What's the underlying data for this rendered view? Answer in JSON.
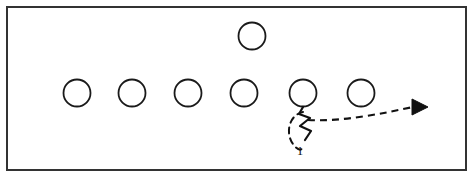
{
  "diagram": {
    "canvas": {
      "width": 474,
      "height": 177,
      "background": "#ffffff"
    },
    "frame": {
      "x": 7,
      "y": 7,
      "width": 459,
      "height": 163,
      "stroke": "#333333",
      "stroke_width": 2
    },
    "colors": {
      "ink": "#111111",
      "circle_stroke": "#1a1a1a",
      "frame_stroke": "#333333",
      "fill": "#ffffff"
    },
    "players": [
      {
        "id": "player-1",
        "label": "",
        "cx": 77,
        "cy": 93,
        "r": 13.5,
        "row": "line"
      },
      {
        "id": "player-2",
        "label": "",
        "cx": 132,
        "cy": 93,
        "r": 13.5,
        "row": "line"
      },
      {
        "id": "player-3",
        "label": "",
        "cx": 188,
        "cy": 93,
        "r": 13.5,
        "row": "line"
      },
      {
        "id": "player-4",
        "label": "",
        "cx": 244,
        "cy": 93,
        "r": 13.5,
        "row": "line"
      },
      {
        "id": "player-5",
        "label": "",
        "cx": 303,
        "cy": 93,
        "r": 13.5,
        "row": "line"
      },
      {
        "id": "player-6",
        "label": "",
        "cx": 361,
        "cy": 93,
        "r": 13.5,
        "row": "line"
      },
      {
        "id": "player-7",
        "label": "",
        "cx": 252,
        "cy": 36,
        "r": 13.5,
        "row": "back"
      }
    ],
    "routes": [
      {
        "id": "route-1",
        "label": "1",
        "label_x": 300,
        "label_y": 155,
        "style": "dashed-with-arrow",
        "origin_player": "player-5",
        "direction": "right",
        "stem_path": "M 303 107 L 300 115 L 310 119 L 301 126 L 311 131 L 306 139",
        "loop_path": "M 303 113 C 290 116 286 132 293 143 C 297 150 301 152 302 147",
        "dash_path": "M 307 120 C 340 121 384 113 414 107",
        "arrow_points": "412,99 412,115 428,107"
      }
    ]
  }
}
